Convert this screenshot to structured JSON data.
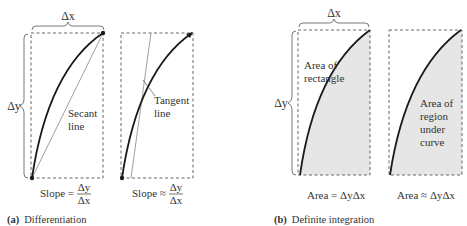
{
  "panel_a": {
    "caption_letter": "(a)",
    "caption_text": "Differentiation",
    "delta_x": "Δx",
    "delta_y": "Δy",
    "secant_label_1": "Secant",
    "secant_label_2": "line",
    "tangent_label_1": "Tangent",
    "tangent_label_2": "line",
    "formula_left": {
      "prefix": "Slope =",
      "numerator": "Δy",
      "denominator": "Δx"
    },
    "formula_right": {
      "prefix": "Slope ≈",
      "numerator": "Δy",
      "denominator": "Δx"
    }
  },
  "panel_b": {
    "caption_letter": "(b)",
    "caption_text": "Definite integration",
    "delta_x": "Δx",
    "delta_y": "Δy",
    "rect_label_1": "Area of",
    "rect_label_2": "rectangle",
    "region_label_1": "Area of",
    "region_label_2": "region",
    "region_label_3": "under",
    "region_label_4": "curve",
    "formula_left": "Area = ΔyΔx",
    "formula_right": "Area ≈ ΔyΔx"
  },
  "colors": {
    "curve": "#1a1a1a",
    "thin_line": "#888888",
    "dash": "#555555",
    "shade": "#e6e6e6"
  }
}
